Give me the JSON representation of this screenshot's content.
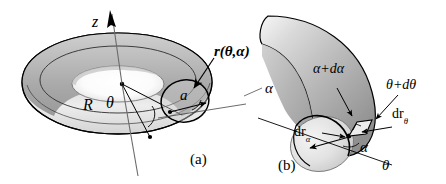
{
  "figure": {
    "background_color": "#ffffff",
    "stroke_color": "#000000",
    "panels": [
      {
        "key": "a",
        "caption": "(a)",
        "description": "full torus with z axis, major radius R, minor radius a, angles theta and alpha"
      },
      {
        "key": "b",
        "caption": "(b)",
        "description": "cut-away quarter torus showing differential element dr_alpha by dr_theta"
      }
    ]
  },
  "panel_a": {
    "caption": "(a)",
    "labels": {
      "z_axis": "z",
      "major_radius": "R",
      "minor_radius": "a",
      "theta": "θ",
      "alpha": "α",
      "position_vector": "r(θ,α)"
    }
  },
  "panel_b": {
    "caption": "(b)",
    "labels": {
      "alpha_plus_dalpha": "α+dα",
      "theta_plus_dtheta": "θ+dθ",
      "dr_alpha_prefix": "dr",
      "dr_alpha_sub": "α",
      "dr_theta_prefix": "dr",
      "dr_theta_sub": "θ",
      "alpha": "α",
      "theta": "θ"
    }
  },
  "colors": {
    "surface_light": "#f2f2f2",
    "surface_mid": "#b8b8b8",
    "surface_dark": "#8c8c8c",
    "surface_darkest": "#6e6e6e",
    "outline": "#000000",
    "thin_line": "#4a4a4a"
  }
}
